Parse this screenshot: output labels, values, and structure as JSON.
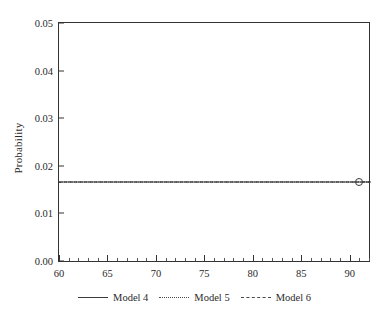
{
  "chart_data": {
    "type": "line",
    "title": "",
    "xlabel": "",
    "ylabel": "Probability",
    "xlim": [
      60,
      92
    ],
    "ylim": [
      0.0,
      0.05
    ],
    "grid": false,
    "legend_position": "bottom",
    "x_ticks": [
      {
        "value": 60,
        "label": "60"
      },
      {
        "value": 65,
        "label": "65"
      },
      {
        "value": 70,
        "label": "70"
      },
      {
        "value": 75,
        "label": "75"
      },
      {
        "value": 80,
        "label": "80"
      },
      {
        "value": 85,
        "label": "85"
      },
      {
        "value": 90,
        "label": "90"
      }
    ],
    "x_minor_tick_interval": 1,
    "y_ticks": [
      {
        "value": 0.0,
        "label": "0.00"
      },
      {
        "value": 0.01,
        "label": "0.01"
      },
      {
        "value": 0.02,
        "label": "0.02"
      },
      {
        "value": 0.03,
        "label": "0.03"
      },
      {
        "value": 0.04,
        "label": "0.04"
      },
      {
        "value": 0.05,
        "label": "0.05"
      }
    ],
    "x": [
      60,
      92
    ],
    "series": [
      {
        "name": "Model 4",
        "style": "solid",
        "values": [
          0.0167,
          0.0167
        ]
      },
      {
        "name": "Model 5",
        "style": "dotted",
        "values": [
          0.0167,
          0.0167
        ]
      },
      {
        "name": "Model 6",
        "style": "dashed",
        "values": [
          0.0167,
          0.0167
        ]
      }
    ],
    "annotations": [
      {
        "name": "end-convergence-marker",
        "x": 91,
        "y": 0.0167,
        "description": "small open circle with short dashed tail where the three overlapping curves terminate"
      }
    ]
  },
  "legend": {
    "entries": [
      {
        "label": "Model 4",
        "style": "solid"
      },
      {
        "label": "Model 5",
        "style": "dotted"
      },
      {
        "label": "Model 6",
        "style": "dashed"
      }
    ]
  },
  "colors": {
    "background": "#ffffff",
    "axis": "#333333",
    "text": "#2a2a2a",
    "series_line": "#3a3a3a"
  }
}
